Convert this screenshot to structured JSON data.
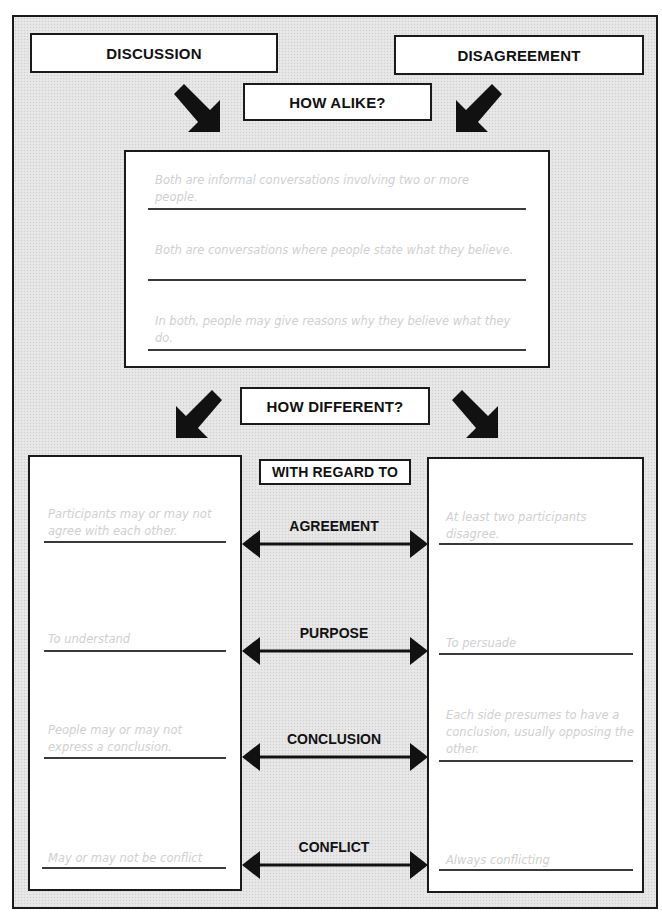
{
  "header": {
    "left_title": "DISCUSSION",
    "right_title": "DISAGREEMENT",
    "alike_label": "HOW ALIKE?",
    "different_label": "HOW DIFFERENT?",
    "regard_label": "WITH REGARD TO"
  },
  "alike": {
    "items": [
      "Both are informal conversations involving two or more people.",
      "Both are conversations where people state what they believe.",
      "In both, people may give reasons why they believe what they do."
    ]
  },
  "differences": {
    "categories": [
      {
        "label": "AGREEMENT",
        "discussion": "Participants may or may not agree with each other.",
        "disagreement": "At least two participants disagree."
      },
      {
        "label": "PURPOSE",
        "discussion": "To understand",
        "disagreement": "To persuade"
      },
      {
        "label": "CONCLUSION",
        "discussion": "People may or may not express a conclusion.",
        "disagreement": "Each side presumes to have a conclusion, usually opposing the other."
      },
      {
        "label": "CONFLICT",
        "discussion": "May or may not be conflict",
        "disagreement": "Always conflicting"
      }
    ]
  },
  "icons": {
    "diagonal_arrows": [
      "arrow-down-right-icon",
      "arrow-down-left-icon",
      "arrow-down-left-icon",
      "arrow-down-right-icon"
    ],
    "double_arrows": [
      "double-arrow-icon"
    ]
  },
  "colors": {
    "ink": "#1a1a1a",
    "background_texture": "#e4e4e4",
    "box_fill": "#ffffff",
    "handwriting": "#cfcfcf"
  }
}
